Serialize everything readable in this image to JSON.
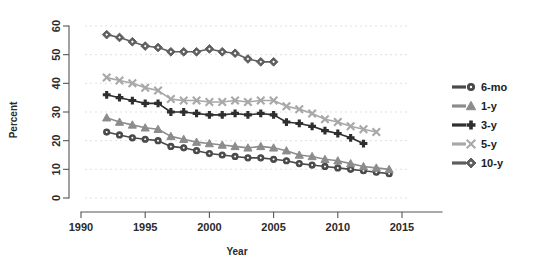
{
  "chart_data": {
    "type": "line",
    "title": "",
    "xlabel": "Year",
    "ylabel": "Percent",
    "xlim": [
      1990,
      2015
    ],
    "ylim": [
      0,
      60
    ],
    "xticks": [
      1990,
      1995,
      2000,
      2005,
      2010,
      2015
    ],
    "yticks": [
      0,
      10,
      20,
      30,
      40,
      50,
      60
    ],
    "grid": true,
    "legend_position": "right",
    "series": [
      {
        "name": "6-mo",
        "marker": "circle",
        "color": "#4a4a4a",
        "x": [
          1992,
          1993,
          1994,
          1995,
          1996,
          1997,
          1998,
          1999,
          2000,
          2001,
          2002,
          2003,
          2004,
          2005,
          2006,
          2007,
          2008,
          2009,
          2010,
          2011,
          2012,
          2013,
          2014
        ],
        "values": [
          23.0,
          22.0,
          21.0,
          20.5,
          20.0,
          18.0,
          17.5,
          16.5,
          15.5,
          15.0,
          14.5,
          14.0,
          14.0,
          13.5,
          13.0,
          12.0,
          11.5,
          11.0,
          10.5,
          10.0,
          9.5,
          9.0,
          8.5
        ]
      },
      {
        "name": "1-y",
        "marker": "triangle",
        "color": "#8c8c8c",
        "x": [
          1992,
          1993,
          1994,
          1995,
          1996,
          1997,
          1998,
          1999,
          2000,
          2001,
          2002,
          2003,
          2004,
          2005,
          2006,
          2007,
          2008,
          2009,
          2010,
          2011,
          2012,
          2013,
          2014
        ],
        "values": [
          28.0,
          26.5,
          25.5,
          24.5,
          24.0,
          21.5,
          20.5,
          19.5,
          19.0,
          18.5,
          18.0,
          17.5,
          18.0,
          17.5,
          16.5,
          15.0,
          14.5,
          13.5,
          13.0,
          12.0,
          11.0,
          10.5,
          10.0
        ]
      },
      {
        "name": "3-y",
        "marker": "plus",
        "color": "#2e2e2e",
        "x": [
          1992,
          1993,
          1994,
          1995,
          1996,
          1997,
          1998,
          1999,
          2000,
          2001,
          2002,
          2003,
          2004,
          2005,
          2006,
          2007,
          2008,
          2009,
          2010,
          2011,
          2012
        ],
        "values": [
          36.0,
          35.0,
          34.0,
          33.0,
          33.0,
          30.0,
          30.0,
          29.5,
          29.0,
          29.0,
          29.5,
          29.0,
          29.5,
          29.0,
          26.5,
          26.0,
          25.0,
          23.5,
          22.5,
          21.0,
          19.0
        ]
      },
      {
        "name": "5-y",
        "marker": "x",
        "color": "#a8a8a8",
        "x": [
          1992,
          1993,
          1994,
          1995,
          1996,
          1997,
          1998,
          1999,
          2000,
          2001,
          2002,
          2003,
          2004,
          2005,
          2006,
          2007,
          2008,
          2009,
          2010,
          2011,
          2012,
          2013
        ],
        "values": [
          42.0,
          41.0,
          40.0,
          38.5,
          37.5,
          34.5,
          34.0,
          34.0,
          33.5,
          33.5,
          34.0,
          33.5,
          34.0,
          34.0,
          32.0,
          31.0,
          29.5,
          27.5,
          26.5,
          25.0,
          24.0,
          23.0
        ]
      },
      {
        "name": "10-y",
        "marker": "diamond",
        "color": "#5e5e5e",
        "x": [
          1992,
          1993,
          1994,
          1995,
          1996,
          1997,
          1998,
          1999,
          2000,
          2001,
          2002,
          2003,
          2004,
          2005
        ],
        "values": [
          57.0,
          56.0,
          54.5,
          53.0,
          52.5,
          51.0,
          51.0,
          51.0,
          52.0,
          51.0,
          50.5,
          48.5,
          47.5,
          47.5
        ]
      }
    ]
  },
  "legend": {
    "items": [
      {
        "label": "6-mo"
      },
      {
        "label": "1-y"
      },
      {
        "label": "3-y"
      },
      {
        "label": "5-y"
      },
      {
        "label": "10-y"
      }
    ]
  },
  "axes": {
    "x_title": "Year",
    "y_title": "Percent",
    "x_tick_labels": [
      "1990",
      "1995",
      "2000",
      "2005",
      "2010",
      "2015"
    ],
    "y_tick_labels": [
      "0",
      "10",
      "20",
      "30",
      "40",
      "50",
      "60"
    ]
  }
}
